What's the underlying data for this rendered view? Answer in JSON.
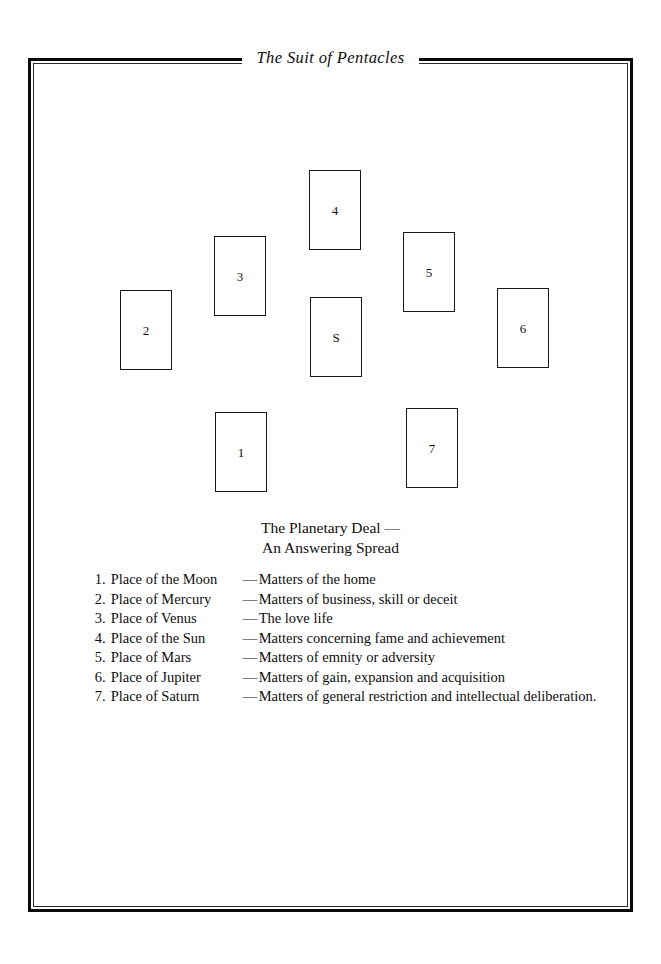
{
  "page": {
    "running_head": "The Suit of Pentacles",
    "background_color": "#ffffff",
    "ink_color": "#111111"
  },
  "frame": {
    "style": "double-rule-border"
  },
  "spread": {
    "caption_line_1": "The Planetary Deal —",
    "caption_line_2": "An Answering Spread",
    "cards": [
      {
        "label": "2",
        "left": 120,
        "top": 290
      },
      {
        "label": "3",
        "left": 214,
        "top": 236
      },
      {
        "label": "4",
        "left": 309,
        "top": 170
      },
      {
        "label": "S",
        "left": 310,
        "top": 297
      },
      {
        "label": "5",
        "left": 403,
        "top": 232
      },
      {
        "label": "6",
        "left": 497,
        "top": 288
      },
      {
        "label": "1",
        "left": 215,
        "top": 412
      },
      {
        "label": "7",
        "left": 406,
        "top": 408
      }
    ]
  },
  "key": {
    "dash": "—",
    "dot": ".",
    "rows": [
      {
        "num": "1",
        "place": "Place of the Moon",
        "desc": "Matters of the home"
      },
      {
        "num": "2",
        "place": "Place of Mercury",
        "desc": "Matters of business, skill or deceit"
      },
      {
        "num": "3",
        "place": "Place of Venus",
        "desc": "The love life"
      },
      {
        "num": "4",
        "place": "Place of the Sun",
        "desc": "Matters concerning fame and achievement"
      },
      {
        "num": "5",
        "place": "Place of Mars",
        "desc": "Matters of emnity or adversity"
      },
      {
        "num": "6",
        "place": "Place of Jupiter",
        "desc": "Matters of gain, expansion and acquisition"
      },
      {
        "num": "7",
        "place": "Place of Saturn",
        "desc": "Matters of general restriction and intellectual deliberation."
      }
    ]
  }
}
